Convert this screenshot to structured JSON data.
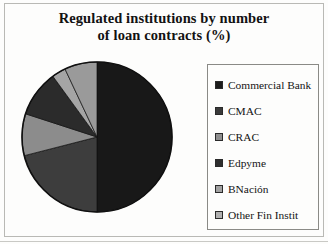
{
  "chart_data": {
    "type": "pie",
    "title": "Regulated institutions by number of loan contracts (%)",
    "title_line1": "Regulated institutions by number",
    "title_line2": "of loan contracts (%)",
    "xlabel": "",
    "ylabel": "",
    "legend_position": "right",
    "grid": false,
    "start_angle_deg": 0,
    "direction": "clockwise",
    "categories": [
      "Commercial Bank",
      "CMAC",
      "CRAC",
      "Edpyme",
      "BNación",
      "Other Fin Instit"
    ],
    "values": [
      50,
      21,
      9,
      10,
      3,
      7
    ],
    "colors": [
      "#181818",
      "#3d3d3d",
      "#8c8c8c",
      "#2b2b2b",
      "#a5a5a5",
      "#9a9a9a"
    ],
    "slices": [
      {
        "label": "Commercial Bank",
        "value": 50,
        "color": "#181818"
      },
      {
        "label": "CMAC",
        "value": 21,
        "color": "#3d3d3d"
      },
      {
        "label": "CRAC",
        "value": 9,
        "color": "#8c8c8c"
      },
      {
        "label": "Edpyme",
        "value": 10,
        "color": "#2b2b2b"
      },
      {
        "label": "BNación",
        "value": 3,
        "color": "#a5a5a5"
      },
      {
        "label": "Other Fin Instit",
        "value": 7,
        "color": "#9a9a9a"
      }
    ]
  },
  "legend": {
    "items": [
      {
        "label": "Commercial Bank",
        "color": "#1c1c1c"
      },
      {
        "label": "CMAC",
        "color": "#3a3a3a"
      },
      {
        "label": "CRAC",
        "color": "#8f8f8f"
      },
      {
        "label": "Edpyme",
        "color": "#2e2e2e"
      },
      {
        "label": "BNación",
        "color": "#a2a2a2"
      },
      {
        "label": "Other Fin Instit",
        "color": "#b0b0b0"
      }
    ]
  },
  "pie_geometry": {
    "cx": 97,
    "cy": 137,
    "r": 75
  }
}
